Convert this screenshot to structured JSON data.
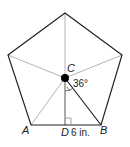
{
  "diagram": {
    "shape": "regular pentagon",
    "labels": {
      "center": "C",
      "vertex_a": "A",
      "vertex_b": "B",
      "foot": "D",
      "angle": "36°",
      "length": "6 in."
    },
    "colors": {
      "outline": "#222222",
      "inner_lines": "#aaaaaa",
      "center_dot": "#000000"
    }
  }
}
